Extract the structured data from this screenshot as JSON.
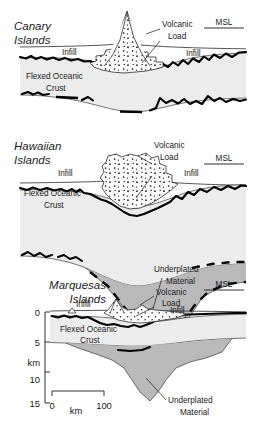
{
  "figure": {
    "kind": "geological-cross-section",
    "colors": {
      "crust_fill": "#ececed",
      "underplate_fill": "#b9b9b9",
      "volcanic_fill": "#ffffff",
      "line": "#000000",
      "text": "#1a1a1a"
    }
  },
  "panels": [
    {
      "id": "canary",
      "title_line1": "Canary",
      "title_line2": "Islands",
      "labels": {
        "volcanic_load_line1": "Volcanic",
        "volcanic_load_line2": "Load",
        "infill_left": "Infill",
        "infill_right": "Infill",
        "crust_line1": "Flexed Oceanic",
        "crust_line2": "Crust",
        "msl": "MSL"
      },
      "has_underplate": false
    },
    {
      "id": "hawaiian",
      "title_line1": "Hawaiian",
      "title_line2": "Islands",
      "labels": {
        "volcanic_load_line1": "Volcanic",
        "volcanic_load_line2": "Load",
        "infill_left": "Infill",
        "infill_right": "Infill",
        "crust_line1": "Flexed Oceanic",
        "crust_line2": "Crust",
        "msl": "MSL",
        "underplate_line1": "Underplated",
        "underplate_line2": "Material"
      },
      "has_underplate": true
    },
    {
      "id": "marquesas",
      "title_line1": "Marquesas",
      "title_line2": "Islands",
      "labels": {
        "volcanic_load_line1": "Volcanic",
        "volcanic_load_line2": "Load",
        "infill_left": "Infill",
        "infill_right": "Infill",
        "crust_line1": "Flexed Oceanic",
        "crust_line2": "Crust",
        "msl": "MSL",
        "underplate_line1": "Underplated",
        "underplate_line2": "Material"
      },
      "has_underplate": true
    }
  ],
  "depth_axis": {
    "unit_label": "km",
    "ticks": [
      "0",
      "5",
      "10",
      "15"
    ],
    "values": [
      0,
      5,
      10,
      15
    ]
  },
  "scale_bar": {
    "start_label": "0",
    "end_label": "100",
    "unit_label": "km",
    "length_km": 100
  }
}
